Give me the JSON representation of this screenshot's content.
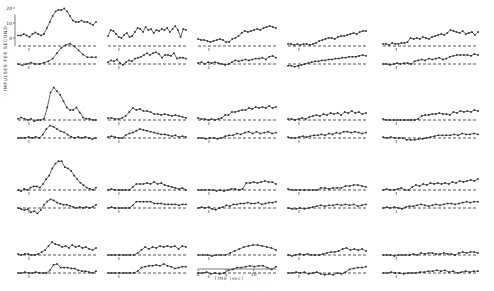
{
  "figure": {
    "ylabel": "IMPULSES PER SECOND",
    "xlabel": "TIME (sec)",
    "y_ticks": [
      "0",
      "10",
      "20"
    ],
    "x_ticks": [
      "0",
      "5",
      "10"
    ],
    "colors": {
      "ink": "#2a2a2a",
      "background": "#ffffff"
    }
  },
  "chart_data": {
    "type": "line",
    "title": "",
    "xlabel": "TIME (sec)",
    "ylabel": "IMPULSES PER SECOND",
    "grid": false,
    "legend": "none",
    "layout": {
      "rows": 4,
      "cols": 5
    },
    "ylim": [
      0,
      25
    ],
    "xlim": [
      0,
      14
    ],
    "y_ticks": [
      0,
      10,
      20
    ],
    "x_ticks": [
      0,
      5,
      10
    ],
    "panels": [
      {
        "row": 1,
        "col": 1,
        "upper": [
          7,
          7,
          8,
          7,
          6,
          8,
          9,
          8,
          7,
          8,
          12,
          16,
          20,
          23,
          24,
          24,
          25,
          23,
          20,
          17,
          16,
          16,
          17,
          16,
          16,
          15,
          14,
          16
        ],
        "lower": [
          0,
          -1,
          0,
          1,
          0,
          0,
          1,
          2,
          4,
          8,
          12,
          14,
          15,
          13,
          10,
          7,
          5,
          5,
          5
        ],
        "upper_base": 8,
        "lower_base": 0
      },
      {
        "row": 1,
        "col": 2,
        "upper": [
          10,
          16,
          15,
          12,
          9,
          8,
          11,
          13,
          9,
          10,
          14,
          18,
          17,
          14,
          19,
          16,
          17,
          13,
          16,
          15,
          17,
          16,
          18,
          14,
          17,
          20,
          16,
          9,
          17,
          16
        ],
        "lower": [
          2,
          4,
          3,
          5,
          1,
          -1,
          2,
          4,
          3,
          6,
          7,
          8,
          10,
          12,
          10,
          12,
          13,
          11,
          7,
          10,
          10,
          9,
          12,
          6,
          7,
          7,
          6
        ],
        "upper_base": 8,
        "lower_base": 3
      },
      {
        "row": 1,
        "col": 3,
        "upper": [
          7,
          6,
          6,
          5,
          4,
          5,
          6,
          7,
          6,
          4,
          4,
          7,
          8,
          10,
          13,
          15,
          14,
          15,
          16,
          17,
          16,
          18,
          19,
          20,
          19,
          18
        ],
        "lower": [
          1,
          2,
          0,
          2,
          1,
          2,
          1,
          0,
          -1,
          0,
          2,
          4,
          3,
          4,
          5,
          4,
          5,
          6,
          6,
          7,
          5,
          8,
          9,
          7
        ],
        "upper_base": 5,
        "lower_base": 1
      },
      {
        "row": 1,
        "col": 4,
        "upper": [
          2,
          2,
          1,
          2,
          1,
          2,
          2,
          1,
          2,
          3,
          5,
          6,
          7,
          8,
          8,
          7,
          9,
          10,
          10,
          11,
          12,
          13,
          12,
          14,
          15,
          15
        ],
        "lower": [
          -2,
          -2,
          -3,
          -2,
          -1,
          0,
          1,
          2,
          3,
          3,
          4,
          4,
          5,
          5,
          6,
          6,
          7,
          7,
          8,
          8,
          8,
          9,
          10,
          9
        ],
        "upper_base": 1,
        "lower_base": -2
      },
      {
        "row": 1,
        "col": 5,
        "upper": [
          2,
          2,
          1,
          3,
          2,
          2,
          3,
          3,
          4,
          8,
          7,
          8,
          7,
          9,
          8,
          7,
          9,
          10,
          11,
          12,
          11,
          13,
          16,
          15,
          14,
          13,
          15,
          12,
          13,
          14,
          11,
          14
        ],
        "lower": [
          0,
          0,
          -1,
          0,
          1,
          0,
          1,
          1,
          0,
          3,
          4,
          5,
          4,
          6,
          5,
          6,
          7,
          5,
          6,
          8,
          9,
          10,
          10,
          10,
          10,
          9,
          11,
          10
        ],
        "upper_base": 2,
        "lower_base": 0
      },
      {
        "row": 2,
        "col": 1,
        "upper": [
          1,
          2,
          1,
          0,
          1,
          -1,
          0,
          0,
          1,
          10,
          22,
          26,
          23,
          20,
          15,
          10,
          8,
          8,
          10,
          6,
          2,
          1,
          1,
          0,
          0
        ],
        "lower": [
          0,
          0,
          0,
          1,
          0,
          1,
          0,
          3,
          8,
          11,
          10,
          8,
          6,
          5,
          3,
          1,
          0,
          1,
          0,
          1,
          0,
          -1,
          0
        ],
        "upper_base": 1,
        "lower_base": 0
      },
      {
        "row": 2,
        "col": 2,
        "upper": [
          2,
          2,
          1,
          1,
          2,
          4,
          8,
          12,
          10,
          11,
          9,
          9,
          8,
          6,
          6,
          5,
          6,
          5,
          4,
          5,
          4,
          3,
          2
        ],
        "lower": [
          1,
          2,
          1,
          0,
          0,
          3,
          5,
          6,
          8,
          10,
          9,
          8,
          7,
          6,
          5,
          4,
          4,
          3,
          2,
          3,
          1,
          2,
          1
        ],
        "upper_base": 1,
        "lower_base": 0
      },
      {
        "row": 2,
        "col": 3,
        "upper": [
          2,
          1,
          1,
          0,
          1,
          0,
          1,
          2,
          5,
          5,
          8,
          8,
          9,
          10,
          10,
          12,
          11,
          13,
          12,
          13,
          12,
          14,
          12,
          13
        ],
        "lower": [
          0,
          0,
          -1,
          0,
          0,
          -1,
          0,
          2,
          3,
          3,
          5,
          4,
          6,
          7,
          5,
          7,
          5,
          6,
          7,
          5,
          6
        ],
        "upper_base": 1,
        "lower_base": 0
      },
      {
        "row": 2,
        "col": 4,
        "upper": [
          1,
          1,
          0,
          1,
          2,
          1,
          3,
          4,
          5,
          4,
          6,
          5,
          7,
          6,
          7,
          5,
          8,
          7,
          9,
          7,
          8,
          6,
          7
        ],
        "lower": [
          1,
          0,
          0,
          1,
          2,
          1,
          2,
          3,
          3,
          4,
          3,
          5,
          4,
          6,
          5,
          7,
          7,
          6,
          7,
          6,
          5,
          6
        ],
        "upper_base": 1,
        "lower_base": 1
      },
      {
        "row": 2,
        "col": 5,
        "upper": [
          1,
          0,
          0,
          0,
          0,
          0,
          0,
          0,
          0,
          0,
          1,
          4,
          5,
          5,
          6,
          6,
          7,
          6,
          6,
          5,
          8,
          7,
          9,
          8,
          9,
          8,
          10,
          9
        ],
        "lower": [
          1,
          0,
          1,
          0,
          0,
          0,
          -2,
          -2,
          -2,
          -1,
          -1,
          0,
          1,
          2,
          3,
          3,
          3,
          3,
          4,
          3,
          5,
          4,
          4,
          5,
          4
        ],
        "upper_base": 0,
        "lower_base": 0
      },
      {
        "row": 3,
        "col": 1,
        "upper": [
          0,
          -1,
          1,
          0,
          2,
          3,
          3,
          2,
          5,
          9,
          12,
          18,
          22,
          24,
          24,
          19,
          18,
          16,
          12,
          9,
          6,
          4,
          2,
          1,
          0,
          2
        ],
        "lower": [
          0,
          -1,
          -2,
          -1,
          -4,
          -3,
          -5,
          -2,
          3,
          6,
          8,
          7,
          5,
          4,
          3,
          3,
          2,
          1,
          0,
          1,
          0,
          1,
          0,
          1,
          3
        ],
        "upper_base": 1,
        "lower_base": 0
      },
      {
        "row": 3,
        "col": 2,
        "upper": [
          0,
          1,
          0,
          0,
          0,
          0,
          0,
          3,
          6,
          6,
          6,
          7,
          6,
          8,
          6,
          7,
          5,
          4,
          3,
          2,
          1,
          2,
          0
        ],
        "lower": [
          0,
          1,
          0,
          0,
          0,
          0,
          0,
          3,
          7,
          7,
          7,
          7,
          7,
          5,
          5,
          5,
          4,
          4,
          4,
          4,
          3,
          4,
          4
        ],
        "upper_base": 0,
        "lower_base": 0
      },
      {
        "row": 3,
        "col": 3,
        "upper": [
          0,
          0,
          0,
          0,
          0,
          -1,
          0,
          -1,
          0,
          1,
          1,
          0,
          1,
          7,
          7,
          8,
          7,
          8,
          9,
          8,
          8,
          6
        ],
        "lower": [
          0,
          1,
          0,
          1,
          -1,
          -2,
          0,
          1,
          3,
          2,
          4,
          4,
          5,
          5,
          6,
          5,
          5,
          6,
          4,
          5,
          6,
          6,
          7
        ],
        "upper_base": 0,
        "lower_base": 0
      },
      {
        "row": 3,
        "col": 4,
        "upper": [
          1,
          0,
          0,
          0,
          0,
          0,
          0,
          0,
          2,
          2,
          1,
          2,
          2,
          2,
          4,
          4,
          5,
          5,
          4,
          3
        ],
        "lower": [
          0,
          -1,
          -1,
          0,
          -1,
          0,
          1,
          2,
          3,
          2,
          3,
          3,
          4,
          3,
          4,
          3,
          4,
          2,
          3,
          4
        ],
        "upper_base": 0,
        "lower_base": 0
      },
      {
        "row": 3,
        "col": 5,
        "upper": [
          0,
          1,
          0,
          0,
          1,
          2,
          0,
          0,
          3,
          5,
          4,
          6,
          5,
          7,
          6,
          7,
          6,
          7,
          6,
          8,
          7,
          9,
          8,
          9,
          10,
          9,
          11
        ],
        "lower": [
          0,
          1,
          0,
          1,
          0,
          -1,
          1,
          2,
          2,
          3,
          4,
          3,
          2,
          3,
          4,
          3,
          4,
          5,
          5,
          4,
          5,
          6,
          7,
          6,
          7,
          7
        ],
        "upper_base": 0,
        "lower_base": 0
      },
      {
        "row": 4,
        "col": 1,
        "upper": [
          1,
          0,
          1,
          1,
          0,
          0,
          1,
          3,
          5,
          9,
          13,
          11,
          10,
          8,
          9,
          7,
          10,
          8,
          9,
          7,
          8,
          6,
          5,
          7
        ],
        "lower": [
          0,
          0,
          1,
          0,
          0,
          1,
          0,
          0,
          0,
          3,
          9,
          10,
          6,
          6,
          6,
          5,
          5,
          3,
          2,
          2,
          1,
          0,
          2
        ],
        "upper_base": 0,
        "lower_base": 0
      },
      {
        "row": 4,
        "col": 2,
        "upper": [
          0,
          0,
          0,
          0,
          0,
          0,
          0,
          0,
          2,
          5,
          8,
          6,
          8,
          7,
          9,
          8,
          9,
          8,
          9,
          6,
          9,
          8
        ],
        "lower": [
          0,
          0,
          0,
          0,
          0,
          0,
          0,
          0,
          2,
          6,
          7,
          8,
          8,
          9,
          8,
          10,
          8,
          7,
          5,
          6,
          7,
          7
        ],
        "upper_base": 0,
        "lower_base": 0
      },
      {
        "row": 4,
        "col": 3,
        "upper": [
          0,
          0,
          0,
          -1,
          0,
          0,
          0,
          2,
          4,
          6,
          8,
          9,
          10,
          10,
          9,
          8,
          7,
          5
        ],
        "lower": [
          0,
          0,
          1,
          -1,
          0,
          -1,
          0,
          3,
          4,
          6,
          6,
          7,
          8,
          7,
          8,
          8,
          6,
          4,
          7
        ],
        "upper_base": 0,
        "lower_base": 0
      },
      {
        "row": 4,
        "col": 4,
        "upper": [
          0,
          -1,
          0,
          1,
          0,
          1,
          0,
          0,
          0,
          1,
          2,
          3,
          3,
          4,
          6,
          7,
          5,
          6,
          5,
          6,
          4
        ],
        "lower": [
          0,
          0,
          1,
          0,
          1,
          -1,
          0,
          1,
          -1,
          -2,
          -1,
          -2,
          0,
          -1,
          1,
          4,
          5,
          6,
          6,
          7
        ],
        "upper_base": 0,
        "lower_base": 0
      },
      {
        "row": 4,
        "col": 5,
        "upper": [
          0,
          0,
          0,
          -1,
          0,
          0,
          0,
          0,
          1,
          0,
          2,
          1,
          2,
          2,
          1,
          1,
          2,
          1,
          1,
          0,
          2,
          3,
          2,
          3,
          3,
          2
        ],
        "lower": [
          0,
          0,
          1,
          0,
          0,
          -1,
          0,
          0,
          0,
          1,
          1,
          2,
          2,
          3,
          2,
          3,
          1,
          2,
          0,
          1,
          2,
          1,
          2,
          2
        ],
        "upper_base": 0,
        "lower_base": 0
      }
    ]
  }
}
